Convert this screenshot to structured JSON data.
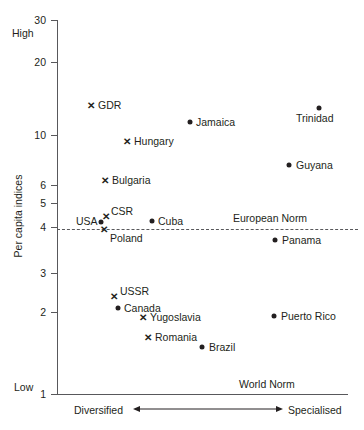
{
  "chart_data": {
    "type": "scatter",
    "title": "",
    "xlabel": "",
    "ylabel": "Per capita indices",
    "yscale": "log",
    "ylim": [
      1,
      30
    ],
    "grid": false,
    "legend": false,
    "y_ticks": [
      "30",
      "20",
      "10",
      "6",
      "5",
      "4",
      "3",
      "2",
      "1"
    ],
    "y_axis_extremes": {
      "high": "High",
      "low": "Low"
    },
    "x_axis_direction": {
      "left": "Diversified",
      "right": "Specialised"
    },
    "annotations": [
      {
        "text": "European Norm",
        "kind": "reference-line-label",
        "y": 4.5
      },
      {
        "text": "World Norm",
        "kind": "baseline-label",
        "y": 1
      }
    ],
    "reference_lines": [
      {
        "name": "European Norm",
        "y": 4.5,
        "style": "dashed"
      },
      {
        "name": "World Norm",
        "y": 1,
        "style": "solid"
      }
    ],
    "series": [
      {
        "name": "Socialist countries",
        "marker": "cross",
        "points": [
          {
            "label": "GDR",
            "x": 12,
            "y": 15.0,
            "px": 91,
            "py": 105,
            "lx": 98,
            "ly": 100
          },
          {
            "label": "Hungary",
            "x": 25,
            "y": 10.4,
            "px": 127,
            "py": 141,
            "lx": 134,
            "ly": 136
          },
          {
            "label": "Bulgaria",
            "x": 17,
            "y": 6.6,
            "px": 105,
            "py": 180,
            "lx": 112,
            "ly": 175
          },
          {
            "label": "CSR",
            "x": 17,
            "y": 5.0,
            "px": 106,
            "py": 216,
            "lx": 111,
            "ly": 206
          },
          {
            "label": "Poland",
            "x": 16,
            "y": 4.4,
            "px": 104,
            "py": 229,
            "lx": 110,
            "ly": 233
          },
          {
            "label": "USSR",
            "x": 20,
            "y": 2.5,
            "px": 114,
            "py": 296,
            "lx": 120,
            "ly": 286
          },
          {
            "label": "Yugoslavia",
            "x": 30,
            "y": 2.0,
            "px": 143,
            "py": 317,
            "lx": 150,
            "ly": 312
          },
          {
            "label": "Romania",
            "x": 32,
            "y": 1.75,
            "px": 148,
            "py": 337,
            "lx": 155,
            "ly": 332
          }
        ]
      },
      {
        "name": "Other countries",
        "marker": "dot",
        "points": [
          {
            "label": "Jamaica",
            "x": 46,
            "y": 12.6,
            "px": 190,
            "py": 122,
            "lx": 196,
            "ly": 117
          },
          {
            "label": "Trinidad",
            "x": 90,
            "y": 14.4,
            "px": 319,
            "py": 108,
            "lx": 296,
            "ly": 113
          },
          {
            "label": "Guyana",
            "x": 80,
            "y": 8.0,
            "px": 289,
            "py": 165,
            "lx": 296,
            "ly": 160
          },
          {
            "label": "Cuba",
            "x": 34,
            "y": 4.8,
            "px": 152,
            "py": 221,
            "lx": 158,
            "ly": 216
          },
          {
            "label": "USA",
            "x": 15,
            "y": 4.7,
            "px": 101,
            "py": 222,
            "lx": 76,
            "ly": 216
          },
          {
            "label": "Panama",
            "x": 75,
            "y": 4.1,
            "px": 275,
            "py": 240,
            "lx": 282,
            "ly": 235
          },
          {
            "label": "Canada",
            "x": 21,
            "y": 2.2,
            "px": 118,
            "py": 308,
            "lx": 124,
            "ly": 303
          },
          {
            "label": "Puerto Rico",
            "x": 75,
            "y": 2.05,
            "px": 274,
            "py": 316,
            "lx": 281,
            "ly": 311
          },
          {
            "label": "Brazil",
            "x": 51,
            "y": 1.6,
            "px": 202,
            "py": 347,
            "lx": 209,
            "ly": 342
          }
        ]
      }
    ]
  },
  "axis": {
    "ticks": [
      {
        "label": "30",
        "py": 20
      },
      {
        "label": "20",
        "py": 62
      },
      {
        "label": "10",
        "py": 135
      },
      {
        "label": "6",
        "py": 185
      },
      {
        "label": "5",
        "py": 203
      },
      {
        "label": "4",
        "py": 227
      },
      {
        "label": "3",
        "py": 273
      },
      {
        "label": "2",
        "py": 312
      },
      {
        "label": "1",
        "py": 394
      }
    ],
    "high_label": "High",
    "low_label": "Low",
    "y_title": "Per capita indices",
    "left_direction": "Diversified",
    "right_direction": "Specialised"
  },
  "notes": {
    "european_norm": "European Norm",
    "world_norm": "World Norm"
  }
}
